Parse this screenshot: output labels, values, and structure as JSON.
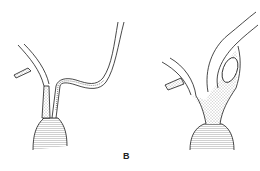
{
  "figure": {
    "panel_label": "B",
    "left_drawing": "normal-vessel-bifurcation",
    "right_drawing": "dilated-vessel-bifurcation",
    "ink_color": "#1a1a1a",
    "stipple_color": "#888888"
  }
}
